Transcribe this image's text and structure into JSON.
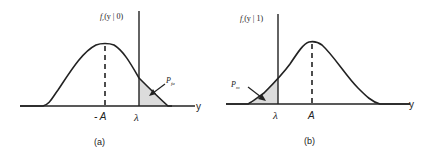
{
  "panels": [
    {
      "id": "a",
      "caption": "(a)",
      "ylabel_fn": "f",
      "ylabel_sub": "r",
      "ylabel_arg": "(y | 0)",
      "axis_label": "y",
      "mean_label": "- A",
      "threshold_label": "λ",
      "area_label_main": "P",
      "area_label_sub": "fa",
      "shaded_side": "right of threshold"
    },
    {
      "id": "b",
      "caption": "(b)",
      "ylabel_fn": "f",
      "ylabel_sub": "r",
      "ylabel_arg": "(y | 1)",
      "axis_label": "y",
      "mean_label": "A",
      "threshold_label": "λ",
      "area_label_main": "P",
      "area_label_sub": "m",
      "shaded_side": "left of threshold"
    }
  ],
  "colors": {
    "stroke": "#222222",
    "shade": "#d9d9d9"
  }
}
